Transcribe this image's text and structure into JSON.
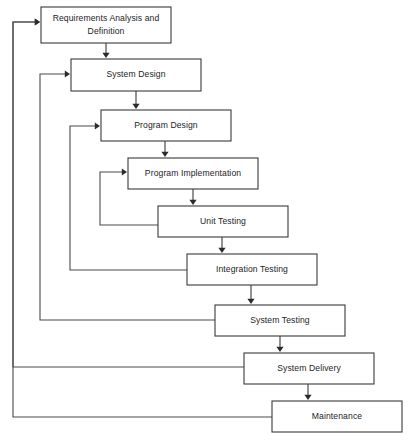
{
  "diagram": {
    "type": "flowchart",
    "canvas": {
      "width": 415,
      "height": 444
    },
    "colors": {
      "box_stroke": "#3a3a3a",
      "box_fill": "#ffffff",
      "text": "#1d1d1d",
      "line": "#4a4a4a",
      "arrow": "#2b2b2b",
      "background": "#ffffff"
    },
    "stages": [
      {
        "id": "requirements",
        "label": "Requirements Analysis and Definition",
        "line1": "Requirements Analysis and",
        "line2": "Definition",
        "x": 41,
        "y": 7,
        "w": 130,
        "h": 36,
        "multiline": true
      },
      {
        "id": "system-design",
        "label": "System Design",
        "line1": "System Design",
        "line2": "",
        "x": 71,
        "y": 59,
        "w": 130,
        "h": 32,
        "multiline": false
      },
      {
        "id": "program-design",
        "label": "Program Design",
        "line1": "Program Design",
        "line2": "",
        "x": 101,
        "y": 110,
        "w": 130,
        "h": 31,
        "multiline": false
      },
      {
        "id": "program-implementation",
        "label": "Program Implementation",
        "line1": "Program Implementation",
        "line2": "",
        "x": 128,
        "y": 158,
        "w": 130,
        "h": 31,
        "multiline": false
      },
      {
        "id": "unit-testing",
        "label": "Unit Testing",
        "line1": "Unit Testing",
        "line2": "",
        "x": 158,
        "y": 206,
        "w": 130,
        "h": 31,
        "multiline": false
      },
      {
        "id": "integration-testing",
        "label": "Integration Testing",
        "line1": "Integration Testing",
        "line2": "",
        "x": 187,
        "y": 254,
        "w": 130,
        "h": 31,
        "multiline": false
      },
      {
        "id": "system-testing",
        "label": "System Testing",
        "line1": "System Testing",
        "line2": "",
        "x": 215,
        "y": 305,
        "w": 130,
        "h": 31,
        "multiline": false
      },
      {
        "id": "system-delivery",
        "label": "System Delivery",
        "line1": "System Delivery",
        "line2": "",
        "x": 244,
        "y": 353,
        "w": 130,
        "h": 31,
        "multiline": false
      },
      {
        "id": "maintenance",
        "label": "Maintenance",
        "line1": "Maintenance",
        "line2": "",
        "x": 272,
        "y": 401,
        "w": 130,
        "h": 31,
        "multiline": false
      }
    ],
    "forward_arrows": [
      {
        "id": "requirements-to-system-design",
        "from": "requirements",
        "to": "system-design",
        "x": 106,
        "y1": 43,
        "y2": 58
      },
      {
        "id": "system-design-to-program-design",
        "from": "system-design",
        "to": "program-design",
        "x": 136,
        "y1": 91,
        "y2": 109
      },
      {
        "id": "program-design-to-program-implementation",
        "from": "program-design",
        "to": "program-implementation",
        "x": 165,
        "y1": 141,
        "y2": 157
      },
      {
        "id": "program-implementation-to-unit-testing",
        "from": "program-implementation",
        "to": "unit-testing",
        "x": 193,
        "y1": 189,
        "y2": 205
      },
      {
        "id": "unit-testing-to-integration-testing",
        "from": "unit-testing",
        "to": "integration-testing",
        "x": 222,
        "y1": 237,
        "y2": 253
      },
      {
        "id": "integration-testing-to-system-testing",
        "from": "integration-testing",
        "to": "system-testing",
        "x": 251,
        "y1": 285,
        "y2": 304
      },
      {
        "id": "system-testing-to-system-delivery",
        "from": "system-testing",
        "to": "system-delivery",
        "x": 280,
        "y1": 336,
        "y2": 352
      },
      {
        "id": "system-delivery-to-maintenance",
        "from": "system-delivery",
        "to": "maintenance",
        "x": 308,
        "y1": 384,
        "y2": 400
      }
    ],
    "feedback_arrows": [
      {
        "id": "unit-testing-to-program-implementation",
        "from": "unit-testing",
        "to": "program-implementation",
        "start_x": 158,
        "start_y": 225,
        "corner_x": 100,
        "end_y": 172,
        "end_x": 127
      },
      {
        "id": "integration-testing-to-program-design",
        "from": "integration-testing",
        "to": "program-design",
        "start_x": 187,
        "start_y": 270,
        "corner_x": 70,
        "end_y": 126,
        "end_x": 100
      },
      {
        "id": "system-testing-to-system-design",
        "from": "system-testing",
        "to": "system-design",
        "start_x": 215,
        "start_y": 320,
        "corner_x": 40,
        "end_y": 74,
        "end_x": 70
      },
      {
        "id": "system-delivery-to-requirements",
        "from": "system-delivery",
        "to": "requirements",
        "start_x": 244,
        "start_y": 367,
        "corner_x": 13,
        "end_y": 22,
        "end_x": 40
      },
      {
        "id": "maintenance-to-requirements",
        "from": "maintenance",
        "to": "requirements",
        "start_x": 272,
        "start_y": 417,
        "corner_x": 13,
        "end_y": 22,
        "end_x": 40
      }
    ]
  }
}
